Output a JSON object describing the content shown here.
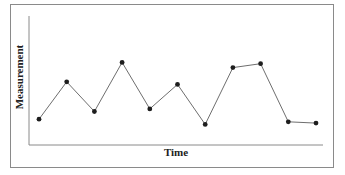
{
  "chart_data": {
    "type": "line",
    "title": "",
    "xlabel": "Time",
    "ylabel": "Measurement",
    "x": [
      1,
      2,
      3,
      4,
      5,
      6,
      7,
      8,
      9,
      10,
      11
    ],
    "series": [
      {
        "name": "Measurement",
        "values": [
          20,
          49,
          26,
          64,
          28,
          47,
          16,
          60,
          63,
          18,
          17
        ]
      }
    ],
    "ylim": [
      0,
      100
    ],
    "xticks": [],
    "yticks": [],
    "grid": false,
    "legend": "none",
    "markers": true,
    "line_color": "#6e6e6e",
    "marker_color": "#1e1e1e",
    "axis_color": "#8a8a8a",
    "frame_color": "#8a8a8a"
  }
}
